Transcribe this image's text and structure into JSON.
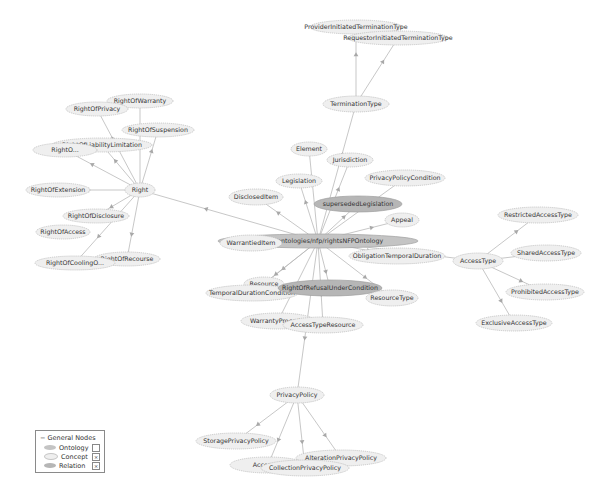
{
  "colors": {
    "concept_fill": "#efefef",
    "concept_stroke": "#b8b8b8",
    "relation_fill": "#b6b6b6",
    "relation_stroke": "#a0a0a0",
    "ontology_fill": "#c4c4c4",
    "edge": "#b9b9b9",
    "arrow": "#a8a8a8"
  },
  "nodes": [
    {
      "id": "ontology",
      "label": "http://www.ip-super.org/ontologies/nfp/rightsNFPOntology",
      "visible_label": "...p.org/ontologies/nfp/rightsNFPOntology",
      "type": "ontology",
      "x": 318,
      "y": 241,
      "rx": 100,
      "ry": 7
    },
    {
      "id": "ProviderInitiatedTerminationType",
      "label": "ProviderInitiatedTerminationType",
      "type": "concept",
      "x": 356,
      "y": 27,
      "rx": 46,
      "ry": 7
    },
    {
      "id": "RequestorInitiatedTerminationType",
      "label": "RequestorInitiatedTerminationType",
      "type": "concept",
      "x": 398,
      "y": 38,
      "rx": 50,
      "ry": 7
    },
    {
      "id": "TerminationType",
      "label": "TerminationType",
      "type": "concept",
      "x": 356,
      "y": 104,
      "rx": 33,
      "ry": 8
    },
    {
      "id": "Element",
      "label": "Element",
      "type": "concept",
      "x": 309,
      "y": 149,
      "rx": 18,
      "ry": 7
    },
    {
      "id": "Jurisdiction",
      "label": "Jurisdiction",
      "type": "concept",
      "x": 350,
      "y": 160,
      "rx": 23,
      "ry": 7
    },
    {
      "id": "Legislation",
      "label": "Legislation",
      "type": "concept",
      "x": 299,
      "y": 181,
      "rx": 23,
      "ry": 7
    },
    {
      "id": "PrivacyPolicyCondition",
      "label": "PrivacyPolicyCondition",
      "type": "concept",
      "x": 405,
      "y": 178,
      "rx": 40,
      "ry": 8
    },
    {
      "id": "DisclosedItem",
      "label": "DisclosedItem",
      "type": "concept",
      "x": 256,
      "y": 197,
      "rx": 27,
      "ry": 8
    },
    {
      "id": "supersededLegislation",
      "label": "supersededLegislation",
      "type": "relation",
      "x": 358,
      "y": 204,
      "rx": 44,
      "ry": 8
    },
    {
      "id": "Appeal",
      "label": "Appeal",
      "type": "concept",
      "x": 402,
      "y": 220,
      "rx": 17,
      "ry": 7
    },
    {
      "id": "WarrantiedItem",
      "label": "WarrantiedItem",
      "type": "concept",
      "x": 251,
      "y": 243,
      "rx": 31,
      "ry": 8
    },
    {
      "id": "ObligationTemporalDuration",
      "label": "ObligationTemporalDuration",
      "type": "concept",
      "x": 397,
      "y": 256,
      "rx": 48,
      "ry": 8
    },
    {
      "id": "Resource",
      "label": "Resource",
      "type": "concept",
      "x": 264,
      "y": 284,
      "rx": 20,
      "ry": 7
    },
    {
      "id": "TemporalDurationCondition",
      "label": "TemporalDurationCondition",
      "type": "concept",
      "x": 252,
      "y": 293,
      "rx": 46,
      "ry": 8
    },
    {
      "id": "RightOfRefusalUnderCondition",
      "label": "RightOfRefusalUnderCondition",
      "type": "relation",
      "x": 330,
      "y": 288,
      "rx": 52,
      "ry": 8
    },
    {
      "id": "ResourceType",
      "label": "ResourceType",
      "type": "concept",
      "x": 392,
      "y": 298,
      "rx": 26,
      "ry": 8
    },
    {
      "id": "WarrantyProcedure",
      "label": "WarrantyProcedure",
      "visible_label": "WarrantyProced...",
      "type": "concept",
      "x": 278,
      "y": 321,
      "rx": 37,
      "ry": 8
    },
    {
      "id": "AccessTypeResource",
      "label": "AccessTypeResource",
      "type": "concept",
      "x": 323,
      "y": 325,
      "rx": 40,
      "ry": 8
    },
    {
      "id": "AccessType",
      "label": "AccessType",
      "type": "concept",
      "x": 478,
      "y": 261,
      "rx": 25,
      "ry": 8
    },
    {
      "id": "RestrictedAccessType",
      "label": "RestrictedAccessType",
      "type": "concept",
      "x": 538,
      "y": 215,
      "rx": 40,
      "ry": 8
    },
    {
      "id": "SharedAccessType",
      "label": "SharedAccessType",
      "type": "concept",
      "x": 546,
      "y": 253,
      "rx": 35,
      "ry": 8
    },
    {
      "id": "ProhibitedAccessType",
      "label": "ProhibitedAccessType",
      "type": "concept",
      "x": 545,
      "y": 292,
      "rx": 39,
      "ry": 8
    },
    {
      "id": "ExclusiveAccessType",
      "label": "ExclusiveAccessType",
      "type": "concept",
      "x": 514,
      "y": 323,
      "rx": 38,
      "ry": 8
    },
    {
      "id": "Right",
      "label": "Right",
      "type": "concept",
      "x": 140,
      "y": 190,
      "rx": 15,
      "ry": 7
    },
    {
      "id": "RightOfWarranty",
      "label": "RightOfWarranty",
      "type": "concept",
      "x": 140,
      "y": 101,
      "rx": 33,
      "ry": 7
    },
    {
      "id": "RightOfPrivacy",
      "label": "RightOfPrivacy",
      "type": "concept",
      "x": 97,
      "y": 109,
      "rx": 31,
      "ry": 7
    },
    {
      "id": "RightOfSuspension",
      "label": "RightOfSuspension",
      "type": "concept",
      "x": 158,
      "y": 130,
      "rx": 36,
      "ry": 7
    },
    {
      "id": "RightOfLiabilityLimitation",
      "label": "RightOfLiabilityLimitation",
      "type": "concept",
      "x": 102,
      "y": 145,
      "rx": 50,
      "ry": 7
    },
    {
      "id": "RightOfCreation",
      "label": "RightOfCreation",
      "visible_label": "RightO...",
      "type": "concept",
      "x": 65,
      "y": 150,
      "rx": 32,
      "ry": 7
    },
    {
      "id": "RightOfExtension",
      "label": "RightOfExtension",
      "type": "concept",
      "x": 58,
      "y": 190,
      "rx": 32,
      "ry": 7
    },
    {
      "id": "RightOfDisclosure",
      "label": "RightOfDisclosure",
      "type": "concept",
      "x": 96,
      "y": 216,
      "rx": 33,
      "ry": 7
    },
    {
      "id": "RightOfAccess",
      "label": "RightOfAccess",
      "type": "concept",
      "x": 63,
      "y": 232,
      "rx": 27,
      "ry": 7
    },
    {
      "id": "RightOfRecourse",
      "label": "RightOfRecourse",
      "type": "concept",
      "x": 127,
      "y": 259,
      "rx": 33,
      "ry": 7
    },
    {
      "id": "RightOfCoolingOff",
      "label": "RightOfCoolingOff",
      "visible_label": "RightOfCoolingO...",
      "type": "concept",
      "x": 75,
      "y": 263,
      "rx": 40,
      "ry": 7
    },
    {
      "id": "PrivacyPolicy",
      "label": "PrivacyPolicy",
      "type": "concept",
      "x": 297,
      "y": 395,
      "rx": 27,
      "ry": 8
    },
    {
      "id": "StoragePrivacyPolicy",
      "label": "StoragePrivacyPolicy",
      "type": "concept",
      "x": 236,
      "y": 441,
      "rx": 40,
      "ry": 8
    },
    {
      "id": "AlterationPrivacyPolicy",
      "label": "AlterationPrivacyPolicy",
      "type": "concept",
      "x": 341,
      "y": 458,
      "rx": 45,
      "ry": 8
    },
    {
      "id": "AccessPrivacyPolicy",
      "label": "AccessPrivacyPolicy",
      "visible_label": "AccessP...",
      "type": "concept",
      "x": 268,
      "y": 465,
      "rx": 38,
      "ry": 8
    },
    {
      "id": "CollectionPrivacyPolicy",
      "label": "CollectionPrivacyPolicy",
      "type": "concept",
      "x": 305,
      "y": 468,
      "rx": 44,
      "ry": 8
    }
  ],
  "edges": [
    [
      "TerminationType",
      "ProviderInitiatedTerminationType"
    ],
    [
      "TerminationType",
      "RequestorInitiatedTerminationType"
    ],
    [
      "ontology",
      "TerminationType"
    ],
    [
      "ontology",
      "Element"
    ],
    [
      "ontology",
      "Jurisdiction"
    ],
    [
      "ontology",
      "Legislation"
    ],
    [
      "ontology",
      "PrivacyPolicyCondition"
    ],
    [
      "ontology",
      "DisclosedItem"
    ],
    [
      "ontology",
      "supersededLegislation"
    ],
    [
      "ontology",
      "Appeal"
    ],
    [
      "ontology",
      "WarrantiedItem"
    ],
    [
      "ontology",
      "ObligationTemporalDuration"
    ],
    [
      "ontology",
      "Resource"
    ],
    [
      "ontology",
      "TemporalDurationCondition"
    ],
    [
      "ontology",
      "RightOfRefusalUnderCondition"
    ],
    [
      "ontology",
      "ResourceType"
    ],
    [
      "ontology",
      "WarrantyProcedure"
    ],
    [
      "ontology",
      "AccessTypeResource"
    ],
    [
      "ontology",
      "AccessType"
    ],
    [
      "ontology",
      "Right"
    ],
    [
      "ontology",
      "PrivacyPolicy"
    ],
    [
      "AccessType",
      "RestrictedAccessType"
    ],
    [
      "AccessType",
      "SharedAccessType"
    ],
    [
      "AccessType",
      "ProhibitedAccessType"
    ],
    [
      "AccessType",
      "ExclusiveAccessType"
    ],
    [
      "Right",
      "RightOfWarranty"
    ],
    [
      "Right",
      "RightOfPrivacy"
    ],
    [
      "Right",
      "RightOfSuspension"
    ],
    [
      "Right",
      "RightOfLiabilityLimitation"
    ],
    [
      "Right",
      "RightOfCreation"
    ],
    [
      "Right",
      "RightOfExtension"
    ],
    [
      "Right",
      "RightOfDisclosure"
    ],
    [
      "Right",
      "RightOfRecourse"
    ],
    [
      "Right",
      "RightOfCoolingOff"
    ],
    [
      "PrivacyPolicy",
      "StoragePrivacyPolicy"
    ],
    [
      "PrivacyPolicy",
      "AccessPrivacyPolicy"
    ],
    [
      "PrivacyPolicy",
      "CollectionPrivacyPolicy"
    ],
    [
      "PrivacyPolicy",
      "AlterationPrivacyPolicy"
    ]
  ],
  "legend": {
    "title": "General Nodes",
    "collapse_symbol": "−",
    "items": [
      {
        "label": "Ontology",
        "type": "ontology",
        "checked": false
      },
      {
        "label": "Concept",
        "type": "concept",
        "checked": true
      },
      {
        "label": "Relation",
        "type": "relation",
        "checked": true
      }
    ],
    "check_mark": "×"
  }
}
